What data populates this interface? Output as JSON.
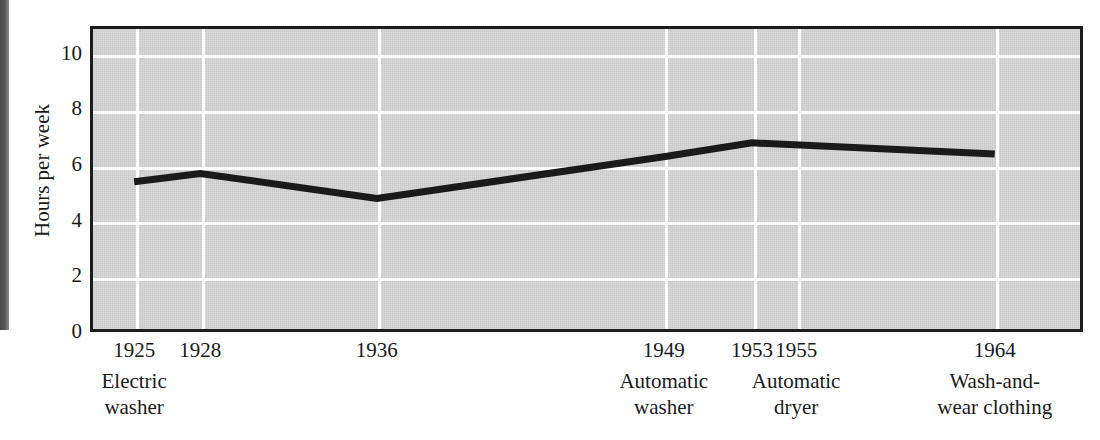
{
  "chart_data": {
    "type": "line",
    "title": "",
    "xlabel": "",
    "ylabel": "Hours per week",
    "ylim": [
      0,
      11
    ],
    "xlim": [
      1923,
      1968
    ],
    "grid": true,
    "legend": "none",
    "yticks": [
      10,
      8,
      6,
      4,
      2,
      0
    ],
    "ytick_labels": [
      "10",
      "8",
      "6",
      "4",
      "2",
      "0"
    ],
    "xticks": [
      1925,
      1928,
      1936,
      1949,
      1953,
      1955,
      1964
    ],
    "xtick_labels": [
      "1925",
      "1928",
      "1936",
      "1949",
      "1953",
      "1955",
      "1964"
    ],
    "x": [
      1925,
      1928,
      1936,
      1949,
      1953,
      1964
    ],
    "values": [
      5.4,
      5.7,
      4.8,
      6.3,
      6.8,
      6.4
    ],
    "series": [
      {
        "name": "Hours per week",
        "x": [
          1925,
          1928,
          1936,
          1949,
          1953,
          1964
        ],
        "values": [
          5.4,
          5.7,
          4.8,
          6.3,
          6.8,
          6.4
        ]
      }
    ],
    "annotations": [
      {
        "year": 1925,
        "line1": "Electric",
        "line2": "washer"
      },
      {
        "year": 1949,
        "line1": "Automatic",
        "line2": "washer"
      },
      {
        "year": 1955,
        "line1": "Automatic",
        "line2": "dryer"
      },
      {
        "year": 1964,
        "line1": "Wash-and-",
        "line2": "wear clothing"
      }
    ],
    "colors": {
      "plot_background": "#c9c9c9",
      "gridline": "#ffffff",
      "series_line": "#1a1a1a",
      "axis_frame": "#1c1c1c",
      "text": "#1a1a1a",
      "page_background": "#ffffff"
    }
  }
}
